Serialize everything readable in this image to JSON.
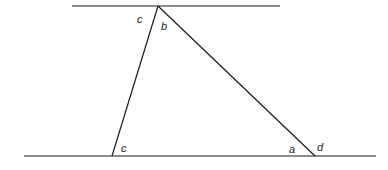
{
  "diagram": {
    "type": "parallel-lines-triangle",
    "colors": {
      "line": "#1a1a1a",
      "background": "#ffffff"
    },
    "lines": {
      "top": {
        "x1": 72,
        "y1": 6,
        "x2": 280,
        "y2": 6
      },
      "bottom": {
        "x1": 24,
        "y1": 156,
        "x2": 376,
        "y2": 156
      }
    },
    "triangle": {
      "apex": {
        "x": 158,
        "y": 6
      },
      "left": {
        "x": 112,
        "y": 156
      },
      "right": {
        "x": 315,
        "y": 156
      }
    },
    "labels": [
      {
        "id": "top-c",
        "text": "c",
        "x": 137,
        "y": 23
      },
      {
        "id": "top-b",
        "text": "b",
        "x": 161,
        "y": 30
      },
      {
        "id": "bottom-c",
        "text": "c",
        "x": 121,
        "y": 152
      },
      {
        "id": "bottom-a",
        "text": "a",
        "x": 289,
        "y": 153
      },
      {
        "id": "bottom-d",
        "text": "d",
        "x": 317,
        "y": 151
      }
    ]
  }
}
